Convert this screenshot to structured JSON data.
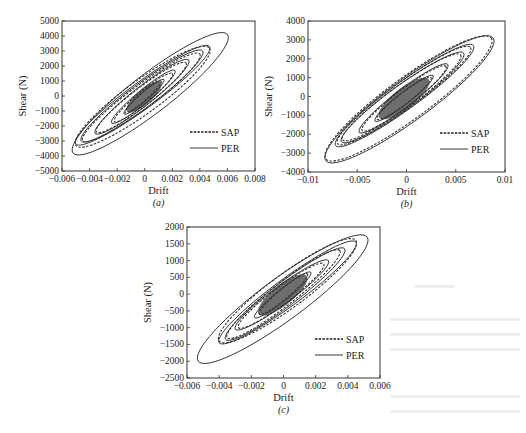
{
  "figure": {
    "panels": [
      "(a)",
      "(b)",
      "(c)"
    ]
  },
  "chart_data": [
    {
      "id": "a",
      "type": "line",
      "panel_label": "(a)",
      "title": "",
      "xlabel": "Drift",
      "ylabel": "Shear (N)",
      "xlim": [
        -0.006,
        0.008
      ],
      "ylim": [
        -5000,
        5000
      ],
      "xticks": [
        -0.006,
        -0.004,
        -0.002,
        0,
        0.002,
        0.004,
        0.006,
        0.008
      ],
      "xtick_labels": [
        "-0.006",
        "-0.004",
        "-0.002",
        "0",
        "0.002",
        "0.004",
        "0.006",
        "0.008"
      ],
      "yticks": [
        5000,
        4000,
        3000,
        2000,
        1000,
        0,
        -1000,
        -2000,
        -3000,
        -4000,
        -5000
      ],
      "ytick_labels": [
        "5000",
        "4000",
        "3000",
        "2000",
        "1000",
        "0",
        "-1000",
        "-2000",
        "-3000",
        "-4000",
        "-5000"
      ],
      "grid": false,
      "legend": {
        "position": "lower right",
        "entries": [
          {
            "name": "SAP",
            "style": "dashed"
          },
          {
            "name": "PER",
            "style": "solid"
          }
        ]
      },
      "series": [
        {
          "name": "SAP",
          "style": "dashed",
          "loops": [
            {
              "max_drift": 0.0047,
              "max_shear": 3200,
              "min_drift": -0.005,
              "min_shear": -3300
            },
            {
              "max_drift": 0.004,
              "max_shear": 2800,
              "min_drift": -0.0045,
              "min_shear": -3000
            },
            {
              "max_drift": 0.003,
              "max_shear": 2200,
              "min_drift": -0.0035,
              "min_shear": -2400
            },
            {
              "max_drift": 0.002,
              "max_shear": 1500,
              "min_drift": -0.0022,
              "min_shear": -1700
            },
            {
              "max_drift": 0.0012,
              "max_shear": 1000,
              "min_drift": -0.0014,
              "min_shear": -1100
            }
          ]
        },
        {
          "name": "PER",
          "style": "solid",
          "loops": [
            {
              "max_drift": 0.006,
              "max_shear": 4100,
              "min_drift": -0.0052,
              "min_shear": -3800
            },
            {
              "max_drift": 0.0047,
              "max_shear": 3300,
              "min_drift": -0.005,
              "min_shear": -3200
            },
            {
              "max_drift": 0.0042,
              "max_shear": 3000,
              "min_drift": -0.0046,
              "min_shear": -3000
            },
            {
              "max_drift": 0.0032,
              "max_shear": 2400,
              "min_drift": -0.0036,
              "min_shear": -2500
            },
            {
              "max_drift": 0.0022,
              "max_shear": 1700,
              "min_drift": -0.0024,
              "min_shear": -1800
            },
            {
              "max_drift": 0.0014,
              "max_shear": 1100,
              "min_drift": -0.0015,
              "min_shear": -1200
            }
          ]
        }
      ]
    },
    {
      "id": "b",
      "type": "line",
      "panel_label": "(b)",
      "title": "",
      "xlabel": "Drift",
      "ylabel": "Shear (N)",
      "xlim": [
        -0.01,
        0.01
      ],
      "ylim": [
        -4000,
        4000
      ],
      "xticks": [
        -0.01,
        -0.005,
        0,
        0.005,
        0.01
      ],
      "xtick_labels": [
        "-0.01",
        "-0.005",
        "0",
        "0.005",
        "0.01"
      ],
      "yticks": [
        4000,
        3000,
        2000,
        1000,
        0,
        -1000,
        -2000,
        -3000,
        -4000
      ],
      "ytick_labels": [
        "4000",
        "3000",
        "2000",
        "1000",
        "0",
        "-1000",
        "-2000",
        "-3000",
        "-4000"
      ],
      "grid": false,
      "legend": {
        "position": "lower right",
        "entries": [
          {
            "name": "SAP",
            "style": "dashed"
          },
          {
            "name": "PER",
            "style": "solid"
          }
        ]
      },
      "series": [
        {
          "name": "SAP",
          "style": "dashed",
          "loops": [
            {
              "max_drift": 0.0086,
              "max_shear": 3100,
              "min_drift": -0.0082,
              "min_shear": -3300
            },
            {
              "max_drift": 0.0065,
              "max_shear": 2600,
              "min_drift": -0.007,
              "min_shear": -2500
            },
            {
              "max_drift": 0.0055,
              "max_shear": 2200,
              "min_drift": -0.0065,
              "min_shear": -2300
            },
            {
              "max_drift": 0.004,
              "max_shear": 1600,
              "min_drift": -0.0045,
              "min_shear": -1800
            },
            {
              "max_drift": 0.0025,
              "max_shear": 1000,
              "min_drift": -0.003,
              "min_shear": -1200
            }
          ]
        },
        {
          "name": "PER",
          "style": "solid",
          "loops": [
            {
              "max_drift": 0.0088,
              "max_shear": 3100,
              "min_drift": -0.0082,
              "min_shear": -3400
            },
            {
              "max_drift": 0.0068,
              "max_shear": 2700,
              "min_drift": -0.0072,
              "min_shear": -2600
            },
            {
              "max_drift": 0.0058,
              "max_shear": 2300,
              "min_drift": -0.0066,
              "min_shear": -2400
            },
            {
              "max_drift": 0.0042,
              "max_shear": 1700,
              "min_drift": -0.0048,
              "min_shear": -1900
            },
            {
              "max_drift": 0.0027,
              "max_shear": 1100,
              "min_drift": -0.0032,
              "min_shear": -1300
            }
          ]
        }
      ]
    },
    {
      "id": "c",
      "type": "line",
      "panel_label": "(c)",
      "title": "",
      "xlabel": "Drift",
      "ylabel": "Shear (N)",
      "xlim": [
        -0.006,
        0.006
      ],
      "ylim": [
        -2500,
        2000
      ],
      "xticks": [
        -0.006,
        -0.004,
        -0.002,
        0,
        0.002,
        0.004,
        0.006
      ],
      "xtick_labels": [
        "-0.006",
        "-0.004",
        "-0.002",
        "0",
        "0.002",
        "0.004",
        "0.006"
      ],
      "yticks": [
        2000,
        1500,
        1000,
        500,
        0,
        -500,
        -1000,
        -1500,
        -2000,
        -2500
      ],
      "ytick_labels": [
        "2000",
        "1500",
        "1000",
        "500",
        "0",
        "-500",
        "-1000",
        "-1500",
        "-2000",
        "-2500"
      ],
      "grid": false,
      "legend": {
        "position": "lower right",
        "entries": [
          {
            "name": "SAP",
            "style": "dashed"
          },
          {
            "name": "PER",
            "style": "solid"
          }
        ]
      },
      "series": [
        {
          "name": "SAP",
          "style": "dashed",
          "loops": [
            {
              "max_drift": 0.0045,
              "max_shear": 1600,
              "min_drift": -0.004,
              "min_shear": -1400
            },
            {
              "max_drift": 0.0035,
              "max_shear": 1300,
              "min_drift": -0.0035,
              "min_shear": -1300
            },
            {
              "max_drift": 0.0025,
              "max_shear": 900,
              "min_drift": -0.0028,
              "min_shear": -1000
            },
            {
              "max_drift": 0.0015,
              "max_shear": 600,
              "min_drift": -0.0015,
              "min_shear": -600
            }
          ]
        },
        {
          "name": "PER",
          "style": "solid",
          "loops": [
            {
              "max_drift": 0.0052,
              "max_shear": 1700,
              "min_drift": -0.0053,
              "min_shear": -2000
            },
            {
              "max_drift": 0.0045,
              "max_shear": 1550,
              "min_drift": -0.004,
              "min_shear": -1450
            },
            {
              "max_drift": 0.0038,
              "max_shear": 1350,
              "min_drift": -0.0036,
              "min_shear": -1350
            },
            {
              "max_drift": 0.0028,
              "max_shear": 1000,
              "min_drift": -0.003,
              "min_shear": -1050
            },
            {
              "max_drift": 0.0017,
              "max_shear": 650,
              "min_drift": -0.0018,
              "min_shear": -700
            }
          ]
        }
      ]
    }
  ]
}
